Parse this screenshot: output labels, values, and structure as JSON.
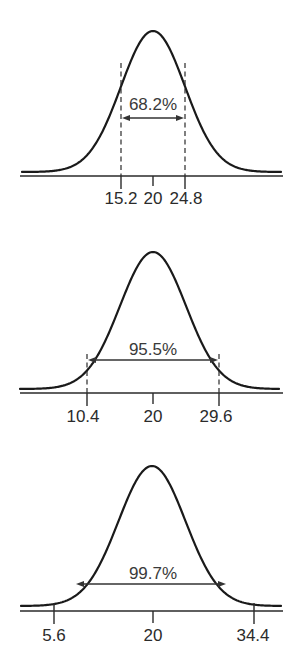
{
  "chart_data": [
    {
      "type": "line",
      "title": "",
      "description": "Normal distribution, mean 20, SD 4.8 — ±1 SD range",
      "mean": 20,
      "sd": 4.8,
      "xlabel": "",
      "ylabel": "",
      "tick_labels": [
        "15.2",
        "20",
        "24.8"
      ],
      "tick_values": [
        15.2,
        20,
        24.8
      ],
      "interval": [
        15.2,
        24.8
      ],
      "interval_style": "dashed verticals",
      "annotation": "68.2%",
      "grid": false
    },
    {
      "type": "line",
      "title": "",
      "description": "Normal distribution, mean 20, SD 4.8 — ±2 SD range",
      "mean": 20,
      "sd": 4.8,
      "xlabel": "",
      "ylabel": "",
      "tick_labels": [
        "10.4",
        "20",
        "29.6"
      ],
      "tick_values": [
        10.4,
        20,
        29.6
      ],
      "interval": [
        10.4,
        29.6
      ],
      "interval_style": "dashed verticals",
      "annotation": "95.5%",
      "grid": false
    },
    {
      "type": "line",
      "title": "",
      "description": "Normal distribution, mean 20, SD 4.8 — ±3 SD range",
      "mean": 20,
      "sd": 4.8,
      "xlabel": "",
      "ylabel": "",
      "tick_labels": [
        "5.6",
        "20",
        "34.4"
      ],
      "tick_values": [
        5.6,
        20,
        34.4
      ],
      "interval": [
        5.6,
        34.4
      ],
      "interval_style": "ticks only",
      "annotation": "99.7%",
      "grid": false
    }
  ],
  "panels": [
    {
      "percent": "68.2%",
      "ticks": [
        "15.2",
        "20",
        "24.8"
      ]
    },
    {
      "percent": "95.5%",
      "ticks": [
        "10.4",
        "20",
        "29.6"
      ]
    },
    {
      "percent": "99.7%",
      "ticks": [
        "5.6",
        "20",
        "34.4"
      ]
    }
  ],
  "colors": {
    "line": "#1a1a1a",
    "text": "#2b2b2b",
    "background": "#ffffff"
  }
}
